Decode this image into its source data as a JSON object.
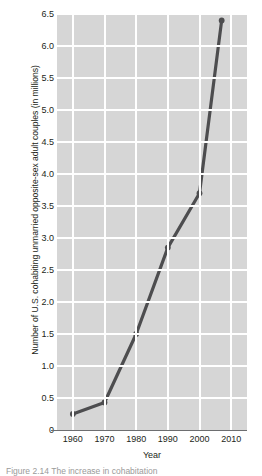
{
  "figure": {
    "caption": "Figure 2.14  The increase in cohabitation"
  },
  "chart_data": {
    "type": "line",
    "title": "",
    "xlabel": "Year",
    "ylabel": "Number of U.S. cohabiting unmarried opposite-sex adult couples (in millions)",
    "x": [
      1960,
      1970,
      1980,
      1990,
      2000,
      2007
    ],
    "values": [
      0.25,
      0.43,
      1.5,
      2.85,
      3.7,
      6.4
    ],
    "xlim": [
      1955,
      2015
    ],
    "ylim": [
      0,
      6.5
    ],
    "xticks": [
      1960,
      1970,
      1980,
      1990,
      2000,
      2010
    ],
    "xtick_labels": [
      "1960",
      "1970",
      "1980",
      "1990",
      "2000",
      "2010"
    ],
    "yticks": [
      0,
      0.5,
      1.0,
      1.5,
      2.0,
      2.5,
      3.0,
      3.5,
      4.0,
      4.5,
      5.0,
      5.5,
      6.0,
      6.5
    ],
    "ytick_labels": [
      "0",
      "0.5",
      "1.0",
      "1.5",
      "2.0",
      "2.5",
      "3.0",
      "3.5",
      "4.0",
      "4.5",
      "5.0",
      "5.5",
      "6.0",
      "6.5"
    ],
    "grid": true,
    "legend": null,
    "series_color": "#4d4d4f",
    "plot_background": "#d6d6d6",
    "grid_color": "#ffffff",
    "marker": "circle"
  }
}
